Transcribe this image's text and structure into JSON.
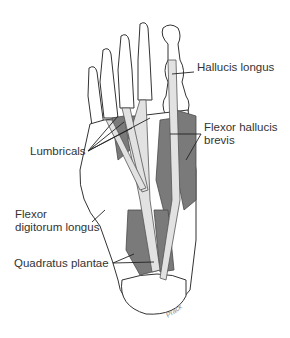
{
  "figure": {
    "labels": [
      {
        "id": "hallucis-longus",
        "text": "Hallucis longus",
        "x": 197,
        "y": 67
      },
      {
        "id": "flexor-hallucis-brevis-1",
        "text": "Flexor hallucis",
        "x": 204,
        "y": 127
      },
      {
        "id": "flexor-hallucis-brevis-2",
        "text": "brevis",
        "x": 204,
        "y": 140
      },
      {
        "id": "lumbricals",
        "text": "Lumbricals",
        "x": 30,
        "y": 146
      },
      {
        "id": "flexor-digitorum-longus-1",
        "text": "Flexor",
        "x": 15,
        "y": 209
      },
      {
        "id": "flexor-digitorum-longus-2",
        "text": "digitorum longus",
        "x": 15,
        "y": 222
      },
      {
        "id": "quadratus-plantae",
        "text": "Quadratus plantae",
        "x": 14,
        "y": 258
      }
    ],
    "signature": "Prack?"
  },
  "colors": {
    "line": "#222222",
    "muscle": "#5a5a5a",
    "tendon": "#d8d8d8",
    "bone": "#ffffff"
  }
}
